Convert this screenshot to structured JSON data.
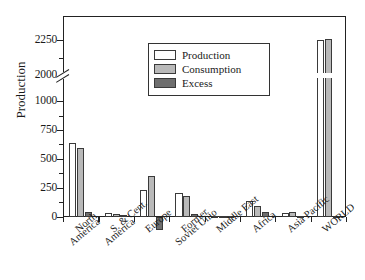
{
  "chart_data": {
    "type": "bar",
    "title": "",
    "xlabel": "",
    "ylabel": "Production",
    "ylim": [
      -150,
      2350
    ],
    "axis_break": {
      "from": 1000,
      "to": 2000,
      "label": "broken y-axis"
    },
    "grid": false,
    "legend_position": "upper center",
    "ytick_labels": [
      "0",
      "250",
      "500",
      "750",
      "1000",
      "2000",
      "2250"
    ],
    "ytick_values": [
      0,
      250,
      500,
      750,
      1000,
      2000,
      2250
    ],
    "categories": [
      "North America",
      "S. & Cent. America",
      "Europe",
      "Former Soviet Unio",
      "Middle East",
      "Africa",
      "Asia Pacific",
      "WORLD"
    ],
    "series": [
      {
        "name": "Production",
        "color": "#ffffff",
        "values": [
          635,
          35,
          232,
          205,
          8,
          135,
          1012,
          2252
        ]
      },
      {
        "name": "Consumption",
        "color": "#b9b9b9",
        "values": [
          592,
          20,
          348,
          180,
          6,
          93,
          1020,
          2258
        ]
      },
      {
        "name": "Excess",
        "color": "#6e6e6e",
        "values": [
          43,
          14,
          -118,
          25,
          2,
          44,
          6,
          4
        ]
      }
    ]
  },
  "legend": {
    "items": [
      {
        "label": "Production"
      },
      {
        "label": "Consumption"
      },
      {
        "label": "Excess"
      }
    ]
  },
  "axis": {
    "y_title": "Production",
    "ticks": [
      {
        "label": "2250"
      },
      {
        "label": "2000"
      },
      {
        "label": "1000"
      },
      {
        "label": "750"
      },
      {
        "label": "500"
      },
      {
        "label": "250"
      },
      {
        "label": "0"
      }
    ]
  },
  "xlabels": [
    {
      "line1": "North",
      "line2": "America"
    },
    {
      "line1": "S. & Cent.",
      "line2": "America"
    },
    {
      "line1": "Europe",
      "line2": ""
    },
    {
      "line1": "Former",
      "line2": "Soviet Unio"
    },
    {
      "line1": "Middle East",
      "line2": ""
    },
    {
      "line1": "Africa",
      "line2": ""
    },
    {
      "line1": "Asia Pacific",
      "line2": ""
    },
    {
      "line1": "WORLD",
      "line2": ""
    }
  ]
}
